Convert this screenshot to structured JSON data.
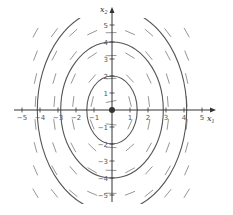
{
  "diagram": {
    "type": "phase-portrait",
    "title": "",
    "x_axis": {
      "label": "x",
      "label_sub": "1",
      "range": [
        -5,
        5
      ],
      "ticks": [
        -5,
        -4,
        -3,
        -2,
        -1,
        1,
        2,
        3,
        4,
        5
      ],
      "tick_labels": [
        "−5",
        "−4",
        "−3",
        "−2",
        "−1",
        "1",
        "2",
        "3",
        "4",
        "5"
      ]
    },
    "y_axis": {
      "label": "x",
      "label_sub": "2",
      "range": [
        -5,
        5
      ],
      "ticks": [
        5,
        4,
        3,
        2,
        1,
        -1,
        -2,
        -3,
        -4,
        -5
      ],
      "tick_labels": [
        "5",
        "4",
        "3",
        "2",
        "1",
        "−1",
        "−2",
        "−3",
        "−4",
        "−5"
      ]
    },
    "equilibrium": {
      "x": 0,
      "y": 0,
      "marker": "filled-dot"
    },
    "trajectories": [
      {
        "kind": "ellipse",
        "style": "solid",
        "semi_axis_x": 1.4,
        "semi_axis_y": 2
      },
      {
        "kind": "ellipse",
        "style": "solid",
        "semi_axis_x": 2.85,
        "semi_axis_y": 4
      },
      {
        "kind": "ellipse",
        "style": "solid",
        "semi_axis_x": 4.15,
        "semi_axis_y": 6
      }
    ],
    "direction_field": {
      "style": "dashed-segments",
      "color": "#8a8a8a",
      "tangent_to": "ellipses"
    },
    "colors": {
      "axis": "#333333",
      "curve": "#555555",
      "field": "#8a8a8a",
      "background": "#ffffff"
    }
  }
}
